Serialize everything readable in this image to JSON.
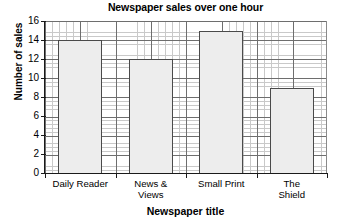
{
  "chart_data": {
    "type": "bar",
    "title": "Newspaper sales over one hour",
    "xlabel": "Newspaper title",
    "ylabel": "Number of sales",
    "categories": [
      "Daily Reader",
      "News &\nViews",
      "Small Print",
      "The Shield"
    ],
    "values": [
      14,
      12,
      15,
      9
    ],
    "ylim": [
      0,
      16
    ],
    "ytick_labels": [
      "0",
      "2",
      "4",
      "6",
      "8",
      "10",
      "12",
      "14",
      "16"
    ],
    "ytick_values": [
      0,
      2,
      4,
      6,
      8,
      10,
      12,
      14,
      16
    ],
    "ytick_step": 2,
    "grid": true,
    "grid_style": "graph-paper",
    "grid_minor_step_y": 0.4,
    "grid_minor_per_major": 5,
    "legend": false,
    "legend_position": "none",
    "bar_fill_color": "#ededed",
    "bar_edge_color": "#4a4a4a",
    "axis_color": "#1a1a1a",
    "grid_major_color": "#6e6e6e",
    "grid_minor_color": "#c9c9c9",
    "background_color": "#ffffff"
  }
}
